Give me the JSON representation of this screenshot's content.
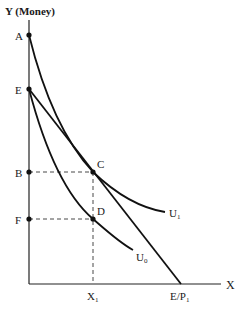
{
  "diagram": {
    "y_axis_label": "Y (Money)",
    "x_axis_label": "X",
    "points": [
      {
        "id": "A",
        "label": "A"
      },
      {
        "id": "E",
        "label": "E"
      },
      {
        "id": "B",
        "label": "B"
      },
      {
        "id": "F",
        "label": "F"
      },
      {
        "id": "C",
        "label": "C"
      },
      {
        "id": "D",
        "label": "D"
      }
    ],
    "x_ticks": [
      {
        "label": "X",
        "sub": "1"
      },
      {
        "label": "E/P",
        "sub": "1"
      }
    ],
    "curves": [
      {
        "id": "U1",
        "label": "U",
        "sub": "1"
      },
      {
        "id": "U0",
        "label": "U",
        "sub": "0"
      }
    ],
    "budget_line": {
      "from": "E",
      "to": "E/P1"
    }
  }
}
